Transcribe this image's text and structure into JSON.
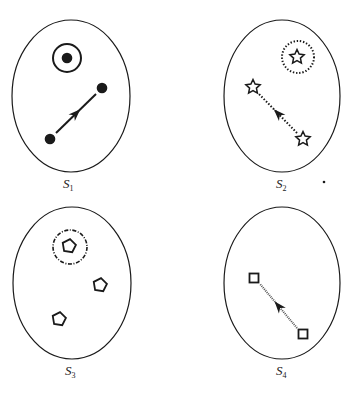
{
  "figure": {
    "panels": [
      {
        "id": "S1",
        "label": "S",
        "subscript": "1",
        "ellipse": {
          "cx": 71,
          "cy": 96,
          "rx": 59,
          "ry": 76
        },
        "marker": "filled-circle",
        "highlight": {
          "style": "solid",
          "cx": 67,
          "cy": 58,
          "r": 14
        },
        "items": [
          {
            "x": 67,
            "y": 58
          },
          {
            "x": 102,
            "y": 88
          },
          {
            "x": 50,
            "y": 139
          }
        ],
        "arrow": {
          "from": [
            56,
            133
          ],
          "to": [
            96,
            94
          ],
          "style": "solid"
        }
      },
      {
        "id": "S2",
        "label": "S",
        "subscript": "2",
        "ellipse": {
          "cx": 282,
          "cy": 96,
          "rx": 58,
          "ry": 76
        },
        "marker": "hollow-star",
        "highlight": {
          "style": "dotted",
          "cx": 298,
          "cy": 57,
          "r": 16
        },
        "items": [
          {
            "x": 297,
            "y": 57
          },
          {
            "x": 253,
            "y": 87
          },
          {
            "x": 303,
            "y": 139
          }
        ],
        "arrow": {
          "from": [
            297,
            133
          ],
          "to": [
            259,
            94
          ],
          "style": "dotted"
        }
      },
      {
        "id": "S3",
        "label": "S",
        "subscript": "3",
        "ellipse": {
          "cx": 72,
          "cy": 283,
          "rx": 59,
          "ry": 76
        },
        "marker": "hollow-pentagon",
        "highlight": {
          "style": "dash-dot",
          "cx": 70,
          "cy": 247,
          "r": 17
        },
        "items": [
          {
            "x": 69,
            "y": 246
          },
          {
            "x": 100,
            "y": 285
          },
          {
            "x": 59,
            "y": 319
          }
        ],
        "arrow": null
      },
      {
        "id": "S4",
        "label": "S",
        "subscript": "4",
        "ellipse": {
          "cx": 282,
          "cy": 283,
          "rx": 58,
          "ry": 76
        },
        "marker": "hollow-square",
        "highlight": null,
        "items": [
          {
            "x": 254,
            "y": 278
          },
          {
            "x": 303,
            "y": 334
          }
        ],
        "arrow": {
          "from": [
            297,
            328
          ],
          "to": [
            260,
            284
          ],
          "style": "dotted-gray"
        }
      }
    ],
    "stray_dot": {
      "x": 324,
      "y": 182
    },
    "colors": {
      "ink": "#1a1a1a",
      "background": "#ffffff"
    }
  }
}
